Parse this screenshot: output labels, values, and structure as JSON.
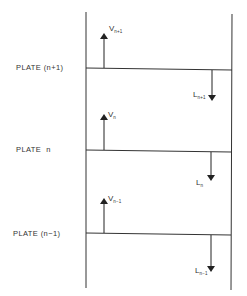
{
  "diagram": {
    "type": "distillation column plate flow schematic",
    "plates": [
      {
        "label": "PLATE (n+1)",
        "vapor": {
          "symbol": "V",
          "subscript": "n+1",
          "direction": "up"
        },
        "liquid": {
          "symbol": "L",
          "subscript": "n+1",
          "direction": "down"
        }
      },
      {
        "label": "PLATE  n",
        "vapor": {
          "symbol": "V",
          "subscript": "n",
          "direction": "up"
        },
        "liquid": {
          "symbol": "L",
          "subscript": "n",
          "direction": "down"
        }
      },
      {
        "label": "PLATE (n−1)",
        "vapor": {
          "symbol": "V",
          "subscript": "n−1",
          "direction": "up"
        },
        "liquid": {
          "symbol": "L",
          "subscript": "n−1",
          "direction": "down"
        }
      }
    ],
    "line_color": "#333333"
  }
}
